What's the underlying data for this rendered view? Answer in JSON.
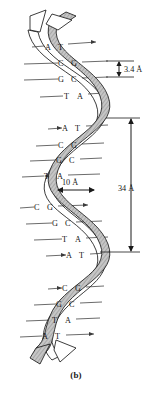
{
  "figure": {
    "label": "(b)",
    "colors": {
      "ribbon_fill": "#b9b9b9",
      "ribbon_stroke": "#1a1a1a",
      "backbone_line": "#1a1a1a",
      "rung_line": "#3a3a3a",
      "text": "#141414",
      "background": "#ffffff"
    }
  },
  "dimensions": [
    {
      "id": "rise",
      "value": "3.4 Å",
      "orientation": "vertical",
      "arrow": "double-headed",
      "description": "rise per base pair"
    },
    {
      "id": "diameter",
      "value": "10 Å",
      "orientation": "horizontal",
      "arrow": "double-headed",
      "description": "helix diameter"
    },
    {
      "id": "pitch",
      "value": "34 Å",
      "orientation": "vertical",
      "arrow": "double-headed",
      "description": "one complete helical turn"
    }
  ],
  "base_pairs": [
    {
      "index": 0,
      "left": "A",
      "right": "T",
      "y": 47
    },
    {
      "index": 1,
      "left": "C",
      "right": "G",
      "y": 63
    },
    {
      "index": 2,
      "left": "G",
      "right": "C",
      "y": 79
    },
    {
      "index": 3,
      "left": "T",
      "right": "A",
      "y": 95
    },
    {
      "index": 4,
      "left": "A",
      "right": "T",
      "y": 128
    },
    {
      "index": 5,
      "left": "C",
      "right": "G",
      "y": 145
    },
    {
      "index": 6,
      "left": "G",
      "right": "C",
      "y": 160
    },
    {
      "index": 7,
      "left": "T",
      "right": "A",
      "y": 176
    },
    {
      "index": 8,
      "left": "C",
      "right": "G",
      "y": 207
    },
    {
      "index": 9,
      "left": "G",
      "right": "C",
      "y": 223
    },
    {
      "index": 10,
      "left": "T",
      "right": "A",
      "y": 239
    },
    {
      "index": 11,
      "left": "A",
      "right": "T",
      "y": 255
    },
    {
      "index": 12,
      "left": "C",
      "right": "G",
      "y": 288
    },
    {
      "index": 13,
      "left": "G",
      "right": "C",
      "y": 304
    },
    {
      "index": 14,
      "left": "T",
      "right": "A",
      "y": 320
    },
    {
      "index": 15,
      "left": "A",
      "right": "T",
      "y": 336
    }
  ]
}
